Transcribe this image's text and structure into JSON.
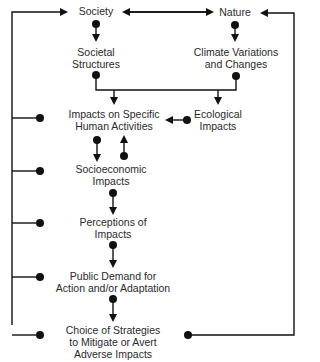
{
  "diagram": {
    "nodes": {
      "society": "Society",
      "nature": "Nature",
      "societal_structures_1": "Societal",
      "societal_structures_2": "Structures",
      "climate_1": "Climate Variations",
      "climate_2": "and Changes",
      "impacts_human_1": "Impacts on Specific",
      "impacts_human_2": "Human Activities",
      "ecological_1": "Ecological",
      "ecological_2": "Impacts",
      "socioeconomic_1": "Socioeconomic",
      "socioeconomic_2": "Impacts",
      "perceptions_1": "Perceptions of",
      "perceptions_2": "Impacts",
      "public_demand_1": "Public Demand for",
      "public_demand_2": "Action and/or Adaptation",
      "choice_1": "Choice of Strategies",
      "choice_2": "to Mitigate or Avert",
      "choice_3": "Adverse Impacts"
    },
    "colors": {
      "line": "#111111",
      "text": "#2a2a2a",
      "background": "#ffffff"
    }
  }
}
